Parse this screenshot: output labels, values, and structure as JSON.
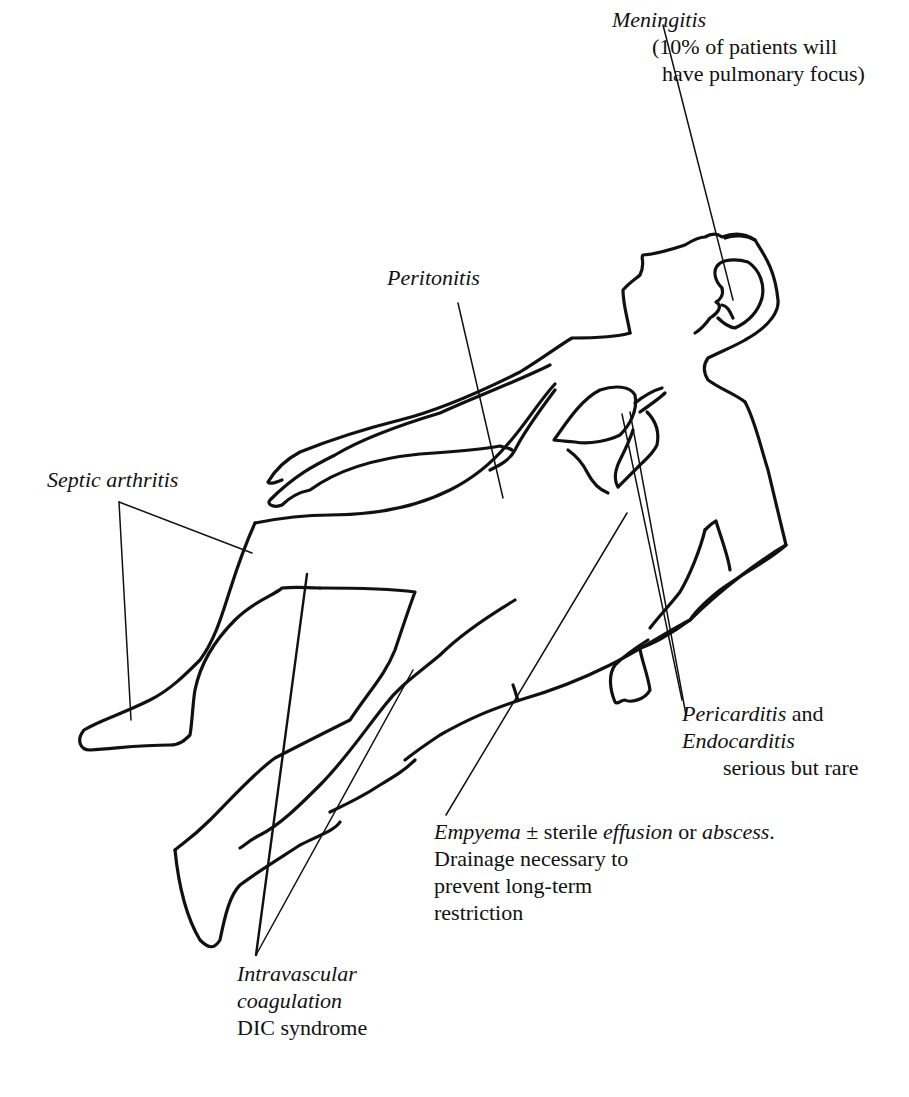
{
  "figure": {
    "stroke_color": "#111111",
    "background_color": "#ffffff"
  },
  "labels": {
    "meningitis": {
      "title": "Meningitis",
      "line1": "(10% of patients will",
      "line2": "have pulmonary focus)"
    },
    "peritonitis": {
      "title": "Peritonitis"
    },
    "septic_arthritis": {
      "title": "Septic arthritis"
    },
    "pericarditis": {
      "title1": "Pericarditis",
      "and": " and",
      "title2": "Endocarditis",
      "note": "serious but rare"
    },
    "empyema": {
      "term1": "Empyema",
      "pm": " ± sterile ",
      "term2": "effusion",
      "or": " or ",
      "term3": "abscess",
      "period": ".",
      "line2": "Drainage necessary to",
      "line3": "prevent long-term",
      "line4": "restriction"
    },
    "dic": {
      "line1": "Intravascular",
      "line2": "coagulation",
      "line3": "DIC syndrome"
    }
  }
}
